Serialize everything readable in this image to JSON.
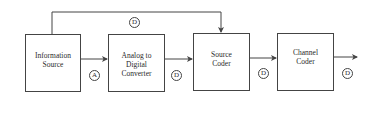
{
  "diagram": {
    "blocks": [
      {
        "id": "info_source",
        "label": "Information\nSource"
      },
      {
        "id": "adc",
        "label": "Analog to\nDigital\nConverter"
      },
      {
        "id": "source_coder",
        "label": "Source\nCoder"
      },
      {
        "id": "channel_coder",
        "label": "Channel\nCoder"
      }
    ],
    "signal_labels": {
      "after_info_source": "A",
      "after_adc": "D",
      "after_source_coder": "D",
      "after_channel_coder": "D",
      "bypass": "D"
    },
    "edges": [
      {
        "from": "info_source",
        "to": "adc",
        "label": "A"
      },
      {
        "from": "adc",
        "to": "source_coder",
        "label": "D"
      },
      {
        "from": "source_coder",
        "to": "channel_coder",
        "label": "D"
      },
      {
        "from": "channel_coder",
        "to": "output",
        "label": "D"
      },
      {
        "from": "info_source",
        "to": "source_coder",
        "label": "D",
        "route": "bypass-top"
      }
    ]
  }
}
